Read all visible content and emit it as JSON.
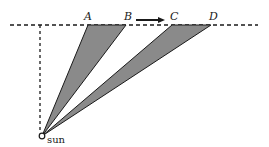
{
  "diagram": {
    "points": {
      "A": {
        "label": "A",
        "x": 88
      },
      "B": {
        "label": "B",
        "x": 126
      },
      "C": {
        "label": "C",
        "x": 172
      },
      "D": {
        "label": "D",
        "x": 211
      }
    },
    "sun_label": "sun",
    "colors": {
      "shade": "#8a8a8a",
      "line": "#1a1a1a"
    }
  }
}
